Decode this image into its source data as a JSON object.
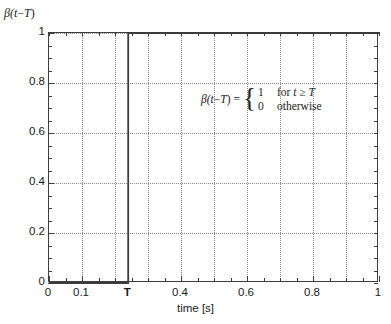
{
  "chart_data": {
    "type": "line",
    "title": "",
    "xlabel": "time [s]",
    "ylabel": "β(t−T)",
    "xlim": [
      0,
      1
    ],
    "ylim": [
      0,
      1
    ],
    "grid": true,
    "legend": null,
    "x_tick_labels": [
      "0",
      "0.1",
      "T",
      "0.4",
      "0.6",
      "0.8",
      "1"
    ],
    "x_tick_values": [
      0,
      0.1,
      0.24,
      0.4,
      0.6,
      0.8,
      1
    ],
    "y_tick_labels": [
      "0",
      "0.2",
      "0.4",
      "0.6",
      "0.8",
      "1"
    ],
    "y_tick_values": [
      0,
      0.2,
      0.4,
      0.6,
      0.8,
      1
    ],
    "x_minor_tick_step": 0.05,
    "y_minor_tick_step": 0.05,
    "step_location_T": 0.24,
    "series": [
      {
        "name": "β(t−T)",
        "x": [
          0,
          0.24,
          0.24,
          1
        ],
        "values": [
          0,
          0,
          1,
          1
        ]
      }
    ],
    "annotations": [
      {
        "name": "definition-equation",
        "lhs": "β(t−T)",
        "equals": "=",
        "cases": [
          {
            "value": "1",
            "condition": "for t ≥ T"
          },
          {
            "value": "0",
            "condition": "otherwise"
          }
        ]
      }
    ]
  },
  "axes": {
    "y_label_beta": "β(",
    "y_label_t": "t",
    "y_label_minus": "−",
    "y_label_T": "T",
    "y_label_close": ")",
    "x_title": "time [s]"
  },
  "equation": {
    "lhs_beta": "β(",
    "lhs_t": "t",
    "lhs_minus": "−",
    "lhs_T": "T",
    "lhs_close": ")",
    "eq": "=",
    "brace": "{",
    "case1_value": "1",
    "case1_condition_for": "for ",
    "case1_condition_t": "t",
    "case1_condition_ge": " ≥ ",
    "case1_condition_T": "T",
    "case2_value": "0",
    "case2_condition": "otherwise"
  },
  "colors": {
    "curve": "#3c3c3c",
    "frame": "#3c3c3c",
    "grid": "#8a8a8a",
    "text": "#1a1a1a",
    "background": "#ffffff"
  }
}
